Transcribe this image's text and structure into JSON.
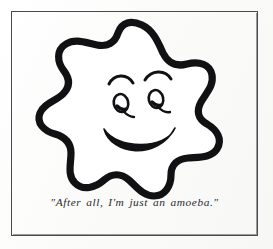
{
  "image": {
    "kind": "cartoon-illustration",
    "caption": "\"After all, I'm just an amoeba.\"",
    "subject_label": "smiling amoeba",
    "background_color": "#fdfdfc",
    "ink_color": "#111114",
    "frame_color": "#4a4a4e",
    "caption_color": "#2b2b2f"
  },
  "frame": {
    "label": "picture-frame"
  },
  "figure": {
    "body_label": "amoeba-body",
    "fill_color": "#ffffff",
    "outline_color": "#111114",
    "outline_width": "7",
    "features": [
      {
        "name": "left-eyebrow",
        "label": "left eyebrow arch"
      },
      {
        "name": "right-eyebrow",
        "label": "right eyebrow arch"
      },
      {
        "name": "left-eye",
        "label": "left eye with lash"
      },
      {
        "name": "right-eye",
        "label": "right eye with lash"
      },
      {
        "name": "mouth",
        "label": "smiling mouth"
      }
    ]
  }
}
